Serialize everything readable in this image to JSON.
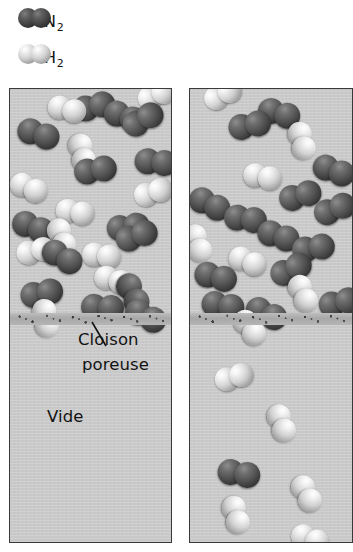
{
  "figure": {
    "title_text": ""
  },
  "legend": {
    "items": [
      {
        "key": "n2",
        "symbol": "N",
        "subscript": "2",
        "icon": "nitrogen-molecule-icon",
        "color": "#3a3a3a",
        "label": "N2"
      },
      {
        "key": "h2",
        "symbol": "H",
        "subscript": "2",
        "icon": "hydrogen-molecule-icon",
        "color": "#e8e8e8",
        "label": "H2"
      }
    ]
  },
  "labels": {
    "partition_line1": "Cloison",
    "partition_line2": "poreuse",
    "vacuum": "Vide"
  },
  "colors": {
    "chamber_fill": "#c9c9c9",
    "panel_border": "#3a3a3a",
    "partition": "#9a9a9a",
    "nitrogen": "#3f3f3f",
    "hydrogen": "#f0f0f0",
    "text": "#131313"
  },
  "panels": [
    {
      "id": "panel-left",
      "name": "before-effusion",
      "upper_chamber": {
        "name": "gas-mixture-chamber",
        "molecules": [
          {
            "type": "n2",
            "x": 60,
            "y": 10,
            "rot": -14
          },
          {
            "type": "h2",
            "x": 41,
            "y": 4,
            "rot": 14
          },
          {
            "type": "n2",
            "x": 99,
            "y": 8,
            "rot": 20
          },
          {
            "type": "h2",
            "x": 124,
            "y": 3,
            "rot": -24
          },
          {
            "type": "n2",
            "x": 12,
            "y": 26,
            "rot": 18
          },
          {
            "type": "h2",
            "x": 79,
            "y": 42,
            "rot": 76
          },
          {
            "type": "n2",
            "x": 108,
            "y": 30,
            "rot": -30
          },
          {
            "type": "n2",
            "x": 126,
            "y": 58,
            "rot": 6
          },
          {
            "type": "n2",
            "x": 62,
            "y": 72,
            "rot": -10
          },
          {
            "type": "h2",
            "x": 6,
            "y": 80,
            "rot": 24
          },
          {
            "type": "h2",
            "x": 121,
            "y": 98,
            "rot": -18
          },
          {
            "type": "h2",
            "x": 48,
            "y": 108,
            "rot": 10
          },
          {
            "type": "n2",
            "x": 8,
            "y": 118,
            "rot": 22
          },
          {
            "type": "n2",
            "x": 95,
            "y": 128,
            "rot": -8
          },
          {
            "type": "h2",
            "x": 56,
            "y": 126,
            "rot": 70
          },
          {
            "type": "h2",
            "x": 4,
            "y": 155,
            "rot": -14
          },
          {
            "type": "n2",
            "x": 40,
            "y": 146,
            "rot": 30
          },
          {
            "type": "h2",
            "x": 74,
            "y": 152,
            "rot": 8
          },
          {
            "type": "n2",
            "x": 102,
            "y": 142,
            "rot": -20
          },
          {
            "type": "h2",
            "x": 88,
            "y": 174,
            "rot": 16
          },
          {
            "type": "n2",
            "x": 125,
            "y": 180,
            "rot": 64
          },
          {
            "type": "n2",
            "x": 8,
            "y": 196,
            "rot": -12
          },
          {
            "type": "n2",
            "x": 72,
            "y": 204,
            "rot": 4
          },
          {
            "type": "h2",
            "x": 44,
            "y": 208,
            "rot": 80
          },
          {
            "type": "n2",
            "x": 122,
            "y": 206,
            "rot": 26
          }
        ]
      },
      "partition": {
        "name": "porous-partition",
        "y": 224
      },
      "lower_chamber": {
        "name": "vacuum-chamber",
        "molecules": []
      }
    },
    {
      "id": "panel-right",
      "name": "after-effusion",
      "upper_chamber": {
        "name": "gas-mixture-chamber",
        "molecules": [
          {
            "type": "h2",
            "x": 10,
            "y": 4,
            "rot": -28
          },
          {
            "type": "n2",
            "x": 72,
            "y": 6,
            "rot": 16
          },
          {
            "type": "n2",
            "x": 36,
            "y": 28,
            "rot": -12
          },
          {
            "type": "h2",
            "x": 118,
            "y": 30,
            "rot": 74
          },
          {
            "type": "n2",
            "x": 128,
            "y": 62,
            "rot": 20
          },
          {
            "type": "h2",
            "x": 56,
            "y": 72,
            "rot": 12
          },
          {
            "type": "n2",
            "x": 6,
            "y": 94,
            "rot": 26
          },
          {
            "type": "n2",
            "x": 86,
            "y": 100,
            "rot": -16
          },
          {
            "type": "n2",
            "x": 36,
            "y": 114,
            "rot": 8
          },
          {
            "type": "n2",
            "x": 120,
            "y": 116,
            "rot": -22
          },
          {
            "type": "n2",
            "x": 72,
            "y": 128,
            "rot": 18
          },
          {
            "type": "h2",
            "x": 12,
            "y": 132,
            "rot": 70
          },
          {
            "type": "n2",
            "x": 100,
            "y": 150,
            "rot": -10
          },
          {
            "type": "h2",
            "x": 44,
            "y": 154,
            "rot": 22
          },
          {
            "type": "n2",
            "x": 8,
            "y": 170,
            "rot": 14
          },
          {
            "type": "n2",
            "x": 76,
            "y": 178,
            "rot": -26
          },
          {
            "type": "h2",
            "x": 116,
            "y": 182,
            "rot": 66
          },
          {
            "type": "n2",
            "x": 14,
            "y": 200,
            "rot": 10
          },
          {
            "type": "n2",
            "x": 126,
            "y": 206,
            "rot": -14
          },
          {
            "type": "n2",
            "x": 62,
            "y": 204,
            "rot": 24
          }
        ]
      },
      "partition": {
        "name": "porous-partition",
        "y": 224
      },
      "lower_chamber": {
        "name": "vacuum-chamber",
        "molecules": [
          {
            "type": "h2",
            "x": 58,
            "y": 216,
            "rot": 54
          },
          {
            "type": "h2",
            "x": 22,
            "y": 282,
            "rot": -16
          },
          {
            "type": "h2",
            "x": 96,
            "y": 312,
            "rot": 70
          },
          {
            "type": "n2",
            "x": 30,
            "y": 368,
            "rot": 10
          },
          {
            "type": "h2",
            "x": 118,
            "y": 382,
            "rot": 62
          },
          {
            "type": "h2",
            "x": 52,
            "y": 404,
            "rot": 74
          },
          {
            "type": "h2",
            "x": 106,
            "y": 432,
            "rot": 20
          }
        ]
      }
    }
  ]
}
